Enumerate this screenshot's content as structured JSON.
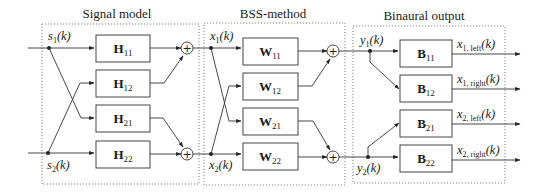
{
  "sections": {
    "signal_model": {
      "title": "Signal model"
    },
    "bss_method": {
      "title": "BSS-method"
    },
    "binaural_output": {
      "title": "Binaural output"
    }
  },
  "signals": {
    "s1": {
      "base": "s",
      "sub": "1",
      "arg": "(k)"
    },
    "s2": {
      "base": "s",
      "sub": "2",
      "arg": "(k)"
    },
    "x1": {
      "base": "x",
      "sub": "1",
      "arg": "(k)"
    },
    "x2": {
      "base": "x",
      "sub": "2",
      "arg": "(k)"
    },
    "y1": {
      "base": "y",
      "sub": "1",
      "arg": "(k)"
    },
    "y2": {
      "base": "y",
      "sub": "2",
      "arg": "(k)"
    }
  },
  "blocks": {
    "H11": {
      "base": "H",
      "sub": "11"
    },
    "H12": {
      "base": "H",
      "sub": "12"
    },
    "H21": {
      "base": "H",
      "sub": "21"
    },
    "H22": {
      "base": "H",
      "sub": "22"
    },
    "W11": {
      "base": "W",
      "sub": "11"
    },
    "W12": {
      "base": "W",
      "sub": "12"
    },
    "W21": {
      "base": "W",
      "sub": "21"
    },
    "W22": {
      "base": "W",
      "sub": "22"
    },
    "B11": {
      "base": "B",
      "sub": "11"
    },
    "B12": {
      "base": "B",
      "sub": "12"
    },
    "B21": {
      "base": "B",
      "sub": "21"
    },
    "B22": {
      "base": "B",
      "sub": "22"
    }
  },
  "outputs": {
    "x1_left": {
      "base": "x",
      "sub": "1, left",
      "arg": "(k)"
    },
    "x1_right": {
      "base": "x",
      "sub": "1, right",
      "arg": "(k)"
    },
    "x2_left": {
      "base": "x",
      "sub": "2, left",
      "arg": "(k)"
    },
    "x2_right": {
      "base": "x",
      "sub": "2, right",
      "arg": "(k)"
    }
  },
  "sum_symbol": "+",
  "colors": {
    "line": "#333333",
    "frame": "#777777",
    "background": "#ffffff"
  }
}
